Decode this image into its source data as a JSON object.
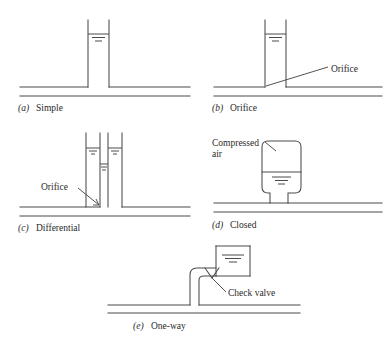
{
  "figure": {
    "stroke_color": "#4a4a4a",
    "text_color": "#2a2a2a",
    "background": "#ffffff"
  },
  "panels": [
    {
      "id": "a",
      "marker": "(a)",
      "caption": "Simple",
      "caption_x": 18,
      "caption_y": 111,
      "water_symbol_label": "water-surface-level",
      "annotations": []
    },
    {
      "id": "b",
      "marker": "(b)",
      "caption": "Orifice",
      "caption_x": 212,
      "caption_y": 111,
      "water_symbol_label": "water-surface-level",
      "annotations": [
        {
          "text": "Orifice",
          "x": 331,
          "y": 72,
          "name": "orifice-label"
        }
      ]
    },
    {
      "id": "c",
      "marker": "(c)",
      "caption": "Differential",
      "caption_x": 18,
      "caption_y": 231,
      "water_symbol_label": "water-surface-level",
      "annotations": [
        {
          "text": "Orifice",
          "x": 41,
          "y": 190,
          "name": "orifice-label"
        }
      ]
    },
    {
      "id": "d",
      "marker": "(d)",
      "caption": "Closed",
      "caption_x": 212,
      "caption_y": 228,
      "water_symbol_label": "water-surface-level",
      "annotations": [
        {
          "text": "Compressed",
          "x": 212,
          "y": 146,
          "name": "compressed-air-label-line1"
        },
        {
          "text": "air",
          "x": 212,
          "y": 157,
          "name": "compressed-air-label-line2"
        }
      ]
    },
    {
      "id": "e",
      "marker": "(e)",
      "caption": "One-way",
      "caption_x": 133,
      "caption_y": 329,
      "water_symbol_label": "water-surface-level",
      "annotations": [
        {
          "text": "Check valve",
          "x": 228,
          "y": 296,
          "name": "check-valve-label"
        }
      ]
    }
  ]
}
